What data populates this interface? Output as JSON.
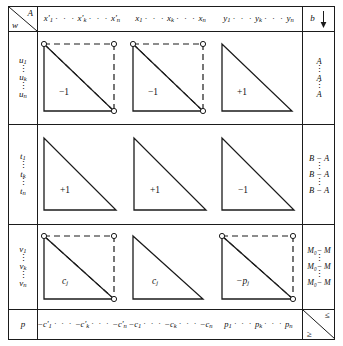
{
  "figure": {
    "type": "block-tableau-diagram",
    "corner": {
      "upper_right": "A",
      "lower_left": "w"
    }
  },
  "column_headers": {
    "block1": {
      "first": "x'",
      "first_sub": "1",
      "middle": "x'",
      "middle_sub": "k",
      "last": "x'",
      "last_sub": "n",
      "dots": "· · ·"
    },
    "block2": {
      "first": "x",
      "first_sub": "1",
      "middle": "x",
      "middle_sub": "k",
      "last": "x",
      "last_sub": "n",
      "dots": "· · ·"
    },
    "block3": {
      "first": "y",
      "first_sub": "1",
      "middle": "y",
      "middle_sub": "k",
      "last": "y",
      "last_sub": "n",
      "dots": "· · ·"
    },
    "rhs": {
      "label": "b",
      "arrow": "down-arrow"
    }
  },
  "row_headers": {
    "block1": {
      "first": "u",
      "first_sub": "1",
      "middle": "u",
      "middle_sub": "k",
      "last": "u",
      "last_sub": "n",
      "vdots": "⋮"
    },
    "block2": {
      "first": "t",
      "first_sub": "1",
      "middle": "t",
      "middle_sub": "k",
      "last": "t",
      "last_sub": "n",
      "vdots": "⋮"
    },
    "block3": {
      "first": "v",
      "first_sub": "1",
      "middle": "v",
      "middle_sub": "k",
      "last": "v",
      "last_sub": "n",
      "vdots": "⋮"
    },
    "bottom": {
      "label": "p"
    }
  },
  "rhs_column": {
    "block1": {
      "first": "A",
      "middle": "A",
      "last": "A",
      "vdots": "⋮"
    },
    "block2": {
      "first": "B − A",
      "middle": "B − A",
      "last": "B − A",
      "vdots": "⋮"
    },
    "block3": {
      "first": "M₀− M",
      "middle": "M₀− M",
      "last": "M₀− M",
      "vdots": "⋮"
    },
    "corner": {
      "upper_right": "≤",
      "lower_left": "≥"
    }
  },
  "bottom_row": {
    "block1": {
      "first": "−c'",
      "first_sub": "1",
      "middle": "−c'",
      "middle_sub": "k",
      "last": "−c'",
      "last_sub": "n",
      "dots": "· · ·"
    },
    "block2": {
      "first": "−c",
      "first_sub": "1",
      "middle": "−c",
      "middle_sub": "k",
      "last": "−c",
      "last_sub": "n",
      "dots": "· · ·"
    },
    "block3": {
      "first": "p",
      "first_sub": "1",
      "middle": "p",
      "middle_sub": "k",
      "last": "p",
      "last_sub": "n",
      "dots": "· · ·"
    }
  },
  "blocks": [
    {
      "id": "r1c1",
      "row": 1,
      "col": 1,
      "label": "−1",
      "triangle": "lower-left",
      "dashed_box": true,
      "dashed_diagonal": true,
      "nodes": 3
    },
    {
      "id": "r1c2",
      "row": 1,
      "col": 2,
      "label": "−1",
      "triangle": "lower-left",
      "dashed_box": true,
      "dashed_diagonal": true,
      "nodes": 3
    },
    {
      "id": "r1c3",
      "row": 1,
      "col": 3,
      "label": "+1",
      "triangle": "lower-left",
      "dashed_box": false,
      "dashed_diagonal": false,
      "nodes": 0
    },
    {
      "id": "r2c1",
      "row": 2,
      "col": 1,
      "label": "+1",
      "triangle": "lower-left",
      "dashed_box": false,
      "dashed_diagonal": false,
      "nodes": 0
    },
    {
      "id": "r2c2",
      "row": 2,
      "col": 2,
      "label": "+1",
      "triangle": "lower-left",
      "dashed_box": false,
      "dashed_diagonal": false,
      "nodes": 0
    },
    {
      "id": "r2c3",
      "row": 2,
      "col": 3,
      "label": "−1",
      "triangle": "lower-left",
      "dashed_box": false,
      "dashed_diagonal": false,
      "nodes": 0
    },
    {
      "id": "r3c1",
      "row": 3,
      "col": 1,
      "label": "c",
      "label_sub": "j",
      "triangle": "lower-left",
      "dashed_box": true,
      "dashed_diagonal": true,
      "nodes": 3
    },
    {
      "id": "r3c2",
      "row": 3,
      "col": 2,
      "label": "c",
      "label_sub": "j",
      "triangle": "lower-left",
      "dashed_box": false,
      "dashed_diagonal": false,
      "nodes": 0
    },
    {
      "id": "r3c3",
      "row": 3,
      "col": 3,
      "label": "−p",
      "label_sub": "j",
      "triangle": "lower-left",
      "dashed_box": true,
      "dashed_diagonal": true,
      "nodes": 3
    }
  ],
  "colors": {
    "ink": "#1b1b1b",
    "paper": "#ffffff"
  }
}
